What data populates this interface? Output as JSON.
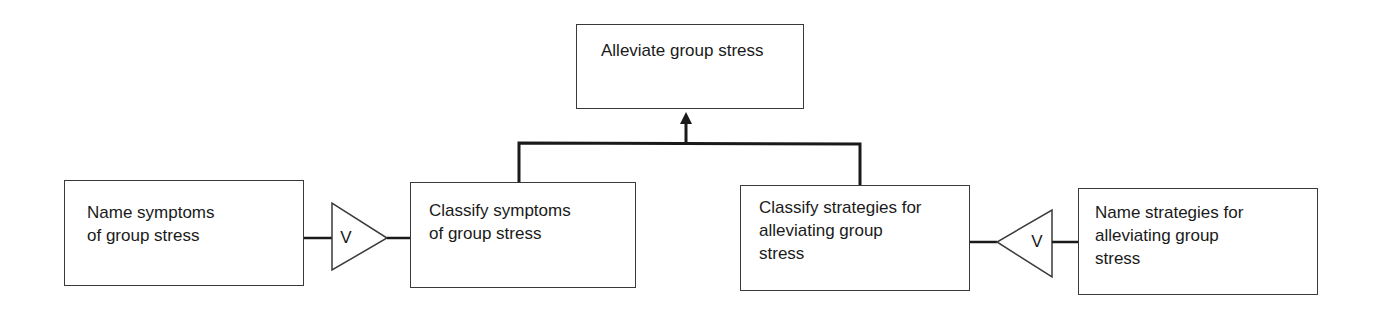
{
  "diagram": {
    "type": "task-decomposition",
    "goal": {
      "id": "goal",
      "lines": [
        "Alleviate group stress"
      ]
    },
    "nodes": [
      {
        "id": "name-symptoms",
        "lines": [
          "Name symptoms",
          "of group stress"
        ]
      },
      {
        "id": "classify-symptoms",
        "lines": [
          "Classify symptoms",
          "of group stress"
        ]
      },
      {
        "id": "classify-strategies",
        "lines": [
          "Classify strategies for",
          "alleviating group",
          "stress"
        ]
      },
      {
        "id": "name-strategies",
        "lines": [
          "Name strategies for",
          "alleviating group",
          "stress"
        ]
      }
    ],
    "connectors": [
      {
        "id": "or-left",
        "symbol": "V",
        "direction": "right",
        "from": "name-symptoms",
        "to": "classify-symptoms"
      },
      {
        "id": "or-right",
        "symbol": "V",
        "direction": "left",
        "from": "name-strategies",
        "to": "classify-strategies"
      }
    ],
    "edges": [
      {
        "from": "classify-symptoms",
        "to": "goal",
        "arrow": "up"
      },
      {
        "from": "classify-strategies",
        "to": "goal",
        "arrow": "up"
      }
    ],
    "colors": {
      "line": "#1a1a1a",
      "border": "#3a3a3a",
      "background": "#ffffff"
    }
  }
}
